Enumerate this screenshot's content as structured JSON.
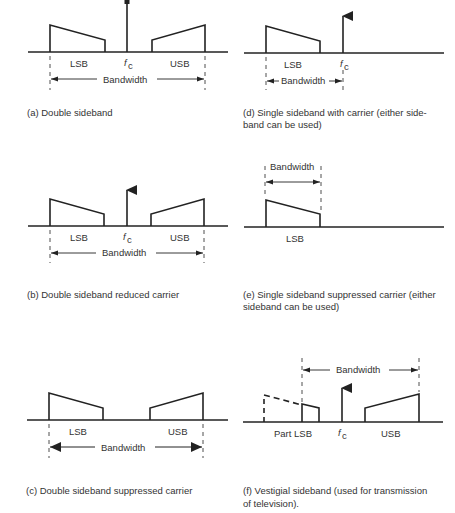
{
  "panels": [
    {
      "id": "a",
      "caption": "(a) Double sideband",
      "labels": {
        "lsb": "LSB",
        "usb": "USB",
        "carrier": "f",
        "carrier_sub": "c",
        "bandwidth": "Bandwidth"
      },
      "carrier": "full",
      "sidebands": [
        "LSB",
        "USB"
      ]
    },
    {
      "id": "b",
      "caption": "(b) Double sideband reduced carrier",
      "labels": {
        "lsb": "LSB",
        "usb": "USB",
        "carrier": "f",
        "carrier_sub": "c",
        "bandwidth": "Bandwidth"
      },
      "carrier": "reduced",
      "sidebands": [
        "LSB",
        "USB"
      ]
    },
    {
      "id": "c",
      "caption": "(c) Double sideband suppressed carrier",
      "labels": {
        "lsb": "LSB",
        "usb": "USB",
        "bandwidth": "Bandwidth"
      },
      "carrier": "suppressed",
      "sidebands": [
        "LSB",
        "USB"
      ]
    },
    {
      "id": "d",
      "caption_line1": "(d) Single sideband with carrier (either side-",
      "caption_line2": "band can be used)",
      "labels": {
        "lsb": "LSB",
        "carrier": "f",
        "carrier_sub": "c",
        "bandwidth": "Bandwidth"
      },
      "carrier": "full",
      "sidebands": [
        "LSB"
      ]
    },
    {
      "id": "e",
      "caption_line1": "(e) Single sideband suppressed carrier (either",
      "caption_line2": "sideband can be used)",
      "labels": {
        "lsb": "LSB",
        "bandwidth": "Bandwidth"
      },
      "carrier": "suppressed",
      "sidebands": [
        "LSB"
      ]
    },
    {
      "id": "f",
      "caption_line1": "(f) Vestigial sideband (used for transmission",
      "caption_line2": "of television).",
      "labels": {
        "lsb": "Part LSB",
        "usb": "USB",
        "carrier": "f",
        "carrier_sub": "c",
        "bandwidth": "Bandwidth"
      },
      "carrier": "full",
      "sidebands": [
        "Part LSB",
        "USB"
      ]
    }
  ]
}
